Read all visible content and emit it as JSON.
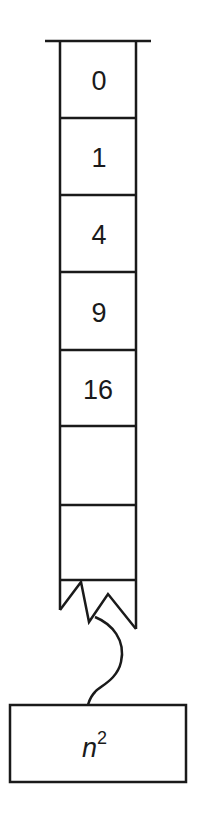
{
  "diagram": {
    "cells": [
      {
        "value": "0"
      },
      {
        "value": "1"
      },
      {
        "value": "4"
      },
      {
        "value": "9"
      },
      {
        "value": "16"
      },
      {
        "value": ""
      },
      {
        "value": ""
      }
    ],
    "generator": {
      "base": "n",
      "exponent": "2"
    },
    "colors": {
      "stroke": "#1a1a1a",
      "background": "#ffffff"
    }
  }
}
